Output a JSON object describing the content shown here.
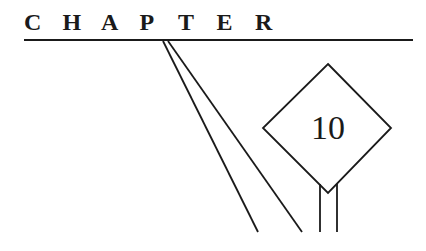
{
  "heading": {
    "word": "CHAPTER",
    "letters": [
      "C",
      "H",
      "A",
      "P",
      "T",
      "E",
      "R"
    ]
  },
  "sign": {
    "number": "10",
    "shape": "diamond"
  },
  "colors": {
    "ink": "#1a1a1a",
    "background": "#ffffff"
  }
}
